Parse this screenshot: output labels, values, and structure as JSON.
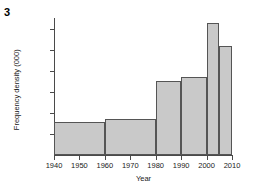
{
  "question_number": "3",
  "chart_data": {
    "type": "bar",
    "title": "",
    "xlabel": "Year",
    "ylabel": "Frequency density (000)",
    "xlim": [
      1940,
      2010
    ],
    "ylim": [
      0,
      13
    ],
    "grid": false,
    "legend": null,
    "xticks": [
      "1940",
      "1950",
      "1960",
      "1970",
      "1980",
      "1990",
      "2000",
      "2010"
    ],
    "xtick_values": [
      1940,
      1950,
      1960,
      1970,
      1980,
      1990,
      2000,
      2010
    ],
    "yticks": [
      "2",
      "4",
      "6",
      "8",
      "10",
      "12"
    ],
    "ytick_values": [
      2,
      4,
      6,
      8,
      10,
      12
    ],
    "bars": [
      {
        "label": "1940-1960",
        "x_start": 1940,
        "x_end": 1960,
        "value": 3.15
      },
      {
        "label": "1960-1980",
        "x_start": 1960,
        "x_end": 1980,
        "value": 3.4
      },
      {
        "label": "1980-1990",
        "x_start": 1980,
        "x_end": 1990,
        "value": 7.0
      },
      {
        "label": "1990-2000",
        "x_start": 1990,
        "x_end": 2000,
        "value": 7.4
      },
      {
        "label": "2000-2005",
        "x_start": 2000,
        "x_end": 2005,
        "value": 12.5
      },
      {
        "label": "2005-2010",
        "x_start": 2005,
        "x_end": 2010,
        "value": 10.3
      }
    ],
    "bar_fill_color": "#c9c9c9",
    "bar_edge_color": "#555555",
    "axis_color": "#4a4a4a"
  }
}
